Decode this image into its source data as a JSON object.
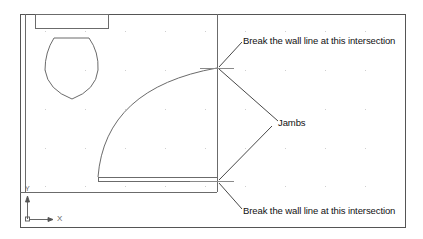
{
  "drawing": {
    "annotations": {
      "top": "Break the wall line at this intersection",
      "middle": "Jambs",
      "bottom": "Break the wall line at this intersection"
    },
    "ucs": {
      "x_label": "X",
      "y_label": "Y"
    },
    "colors": {
      "line": "#6b6b6b",
      "frame": "#555555",
      "leader": "#333333",
      "grid": "#c8c8c8"
    }
  }
}
